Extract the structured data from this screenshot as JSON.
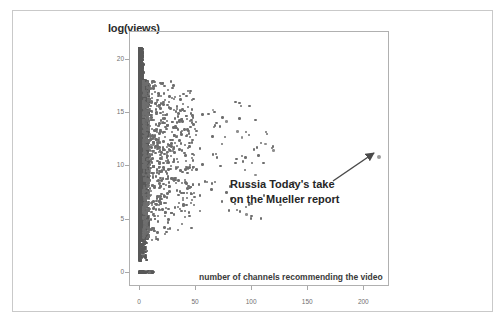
{
  "figure": {
    "background": "#ffffff",
    "frame_color": "#c9c9c9",
    "plot_border_color": "#b0b0b0",
    "point_color": "#585858"
  },
  "chart_data": {
    "type": "scatter",
    "title": "",
    "ylabel": "log(views)",
    "xlabel": "number of channels recommending the video",
    "xlim": [
      -8,
      222
    ],
    "ylim": [
      -1.2,
      22.5
    ],
    "xticks": [
      0,
      50,
      100,
      150,
      200
    ],
    "xtick_labels": [
      "0",
      "50",
      "100",
      "150",
      "200"
    ],
    "yticks": [
      0,
      5,
      10,
      15,
      20
    ],
    "ytick_labels": [
      "0",
      "5",
      "10",
      "15",
      "20"
    ],
    "grid": false,
    "legend": null,
    "annotations": [
      {
        "text_line_1": "Russia Today's take",
        "text_line_2": "on the Mueller report",
        "points_to_x": 208,
        "points_to_y": 10.7,
        "arrow": "up-right"
      }
    ],
    "series": [
      {
        "name": "videos",
        "color": "#585858",
        "points": [
          [
            0.4,
            21.3
          ],
          [
            0.6,
            20.6
          ],
          [
            0.5,
            20.1
          ],
          [
            1.0,
            19.9
          ],
          [
            0.8,
            19.4
          ],
          [
            1.4,
            19.1
          ],
          [
            0.7,
            18.8
          ],
          [
            1.9,
            18.6
          ],
          [
            1.2,
            18.3
          ],
          [
            2.4,
            18.1
          ],
          [
            0.9,
            17.9
          ],
          [
            3.0,
            17.7
          ],
          [
            1.6,
            17.5
          ],
          [
            2.1,
            17.3
          ],
          [
            4.0,
            17.1
          ],
          [
            1.1,
            16.9
          ],
          [
            2.8,
            16.7
          ],
          [
            5.2,
            16.6
          ],
          [
            1.8,
            16.4
          ],
          [
            3.6,
            16.2
          ],
          [
            2.3,
            16.0
          ],
          [
            6.4,
            15.9
          ],
          [
            1.3,
            15.7
          ],
          [
            4.5,
            15.5
          ],
          [
            2.9,
            15.4
          ],
          [
            7.8,
            15.2
          ],
          [
            1.7,
            15.0
          ],
          [
            5.6,
            14.9
          ],
          [
            3.4,
            14.7
          ],
          [
            9.5,
            14.6
          ],
          [
            2.2,
            14.4
          ],
          [
            6.8,
            14.2
          ],
          [
            4.1,
            14.1
          ],
          [
            12.0,
            13.9
          ],
          [
            2.6,
            13.8
          ],
          [
            8.3,
            13.6
          ],
          [
            5.0,
            13.4
          ],
          [
            15.5,
            13.3
          ],
          [
            3.1,
            13.1
          ],
          [
            10.2,
            13.0
          ],
          [
            6.1,
            12.8
          ],
          [
            19.0,
            12.7
          ],
          [
            3.7,
            12.5
          ],
          [
            12.6,
            12.3
          ],
          [
            7.4,
            12.2
          ],
          [
            24.0,
            12.0
          ],
          [
            4.3,
            11.9
          ],
          [
            15.0,
            11.7
          ],
          [
            9.0,
            11.6
          ],
          [
            29.0,
            11.4
          ],
          [
            5.1,
            11.2
          ],
          [
            18.0,
            11.1
          ],
          [
            11.0,
            10.9
          ],
          [
            35.0,
            10.8
          ],
          [
            6.0,
            10.6
          ],
          [
            22.0,
            10.4
          ],
          [
            13.5,
            10.3
          ],
          [
            42.0,
            10.1
          ],
          [
            7.2,
            10.0
          ],
          [
            26.0,
            9.8
          ],
          [
            16.0,
            9.6
          ],
          [
            50.0,
            9.5
          ],
          [
            8.5,
            9.3
          ],
          [
            31.0,
            9.2
          ],
          [
            19.5,
            9.0
          ],
          [
            60.0,
            8.8
          ],
          [
            10.0,
            8.7
          ],
          [
            37.0,
            8.5
          ],
          [
            23.0,
            8.4
          ],
          [
            72.0,
            8.2
          ],
          [
            12.0,
            8.0
          ],
          [
            44.0,
            7.9
          ],
          [
            27.0,
            7.7
          ],
          [
            86.0,
            7.6
          ],
          [
            14.0,
            7.4
          ],
          [
            52.0,
            7.2
          ],
          [
            32.0,
            7.1
          ],
          [
            102.0,
            6.9
          ],
          [
            16.5,
            6.8
          ],
          [
            62.0,
            6.6
          ],
          [
            38.0,
            6.4
          ],
          [
            120.0,
            6.3
          ],
          [
            19.0,
            6.1
          ],
          [
            74.0,
            6.0
          ],
          [
            45.0,
            5.8
          ],
          [
            92.0,
            5.6
          ],
          [
            22.0,
            5.5
          ],
          [
            88.0,
            5.3
          ],
          [
            54.0,
            5.2
          ],
          [
            26.0,
            5.0
          ],
          [
            64.0,
            4.8
          ],
          [
            31.0,
            4.7
          ],
          [
            76.0,
            4.5
          ],
          [
            37.0,
            4.3
          ],
          [
            44.0,
            4.1
          ],
          [
            52.0,
            3.9
          ],
          [
            21.0,
            3.7
          ],
          [
            28.0,
            3.5
          ],
          [
            16.0,
            3.2
          ],
          [
            35.0,
            3.0
          ],
          [
            12.0,
            2.7
          ],
          [
            20.0,
            2.4
          ],
          [
            9.0,
            2.1
          ],
          [
            14.0,
            1.8
          ],
          [
            7.0,
            1.5
          ],
          [
            5.0,
            1.2
          ],
          [
            3.0,
            0.9
          ],
          [
            1.0,
            0.0
          ],
          [
            2.0,
            0.0
          ],
          [
            3.0,
            0.0
          ],
          [
            5.0,
            0.0
          ],
          [
            7.0,
            0.0
          ],
          [
            9.0,
            0.0
          ],
          [
            11.0,
            0.0
          ],
          [
            13.0,
            0.0
          ],
          [
            208.0,
            10.7
          ]
        ]
      }
    ]
  }
}
